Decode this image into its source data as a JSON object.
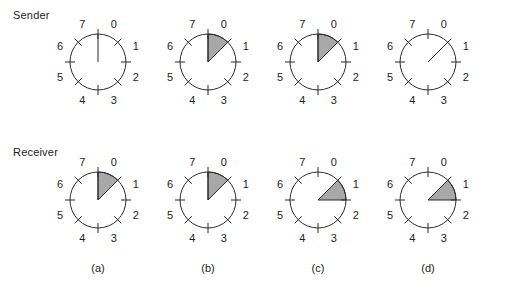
{
  "figure": {
    "width": 510,
    "height": 289,
    "background": "#ffffff",
    "stroke_color": "#2b2b2b",
    "wedge_fill": "#a8a8a8",
    "text_color": "#1c1c1c"
  },
  "rows": [
    {
      "id": "sender",
      "label": "Sender",
      "label_x": 13,
      "label_y": 9,
      "center_y": 62
    },
    {
      "id": "receiver",
      "label": "Receiver",
      "label_x": 13,
      "label_y": 146,
      "center_y": 200
    }
  ],
  "columns": [
    {
      "id": "a",
      "caption": "(a)",
      "center_x": 98
    },
    {
      "id": "b",
      "caption": "(b)",
      "center_x": 208
    },
    {
      "id": "c",
      "caption": "(c)",
      "center_x": 318
    },
    {
      "id": "d",
      "caption": "(d)",
      "center_x": 428
    }
  ],
  "caption_y": 262,
  "clock": {
    "radius": 28,
    "tick_inner": 23,
    "tick_outer": 33,
    "label_radius": 41,
    "sector_labels": [
      "0",
      "1",
      "2",
      "3",
      "4",
      "5",
      "6",
      "7"
    ],
    "sector_label_angles_deg": [
      22.5,
      67.5,
      112.5,
      157.5,
      202.5,
      247.5,
      292.5,
      337.5
    ],
    "tick_angles_deg": [
      0,
      45,
      90,
      135,
      180,
      225,
      270,
      315
    ]
  },
  "panels": [
    {
      "id": "sender-a",
      "row": "sender",
      "column": "a",
      "hand_angle_deg": 0,
      "has_hand": true,
      "wedge": null
    },
    {
      "id": "sender-b",
      "row": "sender",
      "column": "b",
      "hand_angle_deg": 0,
      "has_hand": true,
      "wedge": {
        "start_deg": 0,
        "end_deg": 45
      }
    },
    {
      "id": "sender-c",
      "row": "sender",
      "column": "c",
      "hand_angle_deg": 0,
      "has_hand": true,
      "wedge": {
        "start_deg": 0,
        "end_deg": 45
      }
    },
    {
      "id": "sender-d",
      "row": "sender",
      "column": "d",
      "hand_angle_deg": 45,
      "has_hand": true,
      "wedge": null
    },
    {
      "id": "receiver-a",
      "row": "receiver",
      "column": "a",
      "hand_angle_deg": 0,
      "has_hand": true,
      "wedge": {
        "start_deg": 0,
        "end_deg": 45
      }
    },
    {
      "id": "receiver-b",
      "row": "receiver",
      "column": "b",
      "hand_angle_deg": 0,
      "has_hand": true,
      "wedge": {
        "start_deg": 0,
        "end_deg": 45
      }
    },
    {
      "id": "receiver-c",
      "row": "receiver",
      "column": "c",
      "hand_angle_deg": 45,
      "has_hand": true,
      "wedge": {
        "start_deg": 45,
        "end_deg": 90
      }
    },
    {
      "id": "receiver-d",
      "row": "receiver",
      "column": "d",
      "hand_angle_deg": 45,
      "has_hand": true,
      "wedge": {
        "start_deg": 45,
        "end_deg": 90
      }
    }
  ]
}
